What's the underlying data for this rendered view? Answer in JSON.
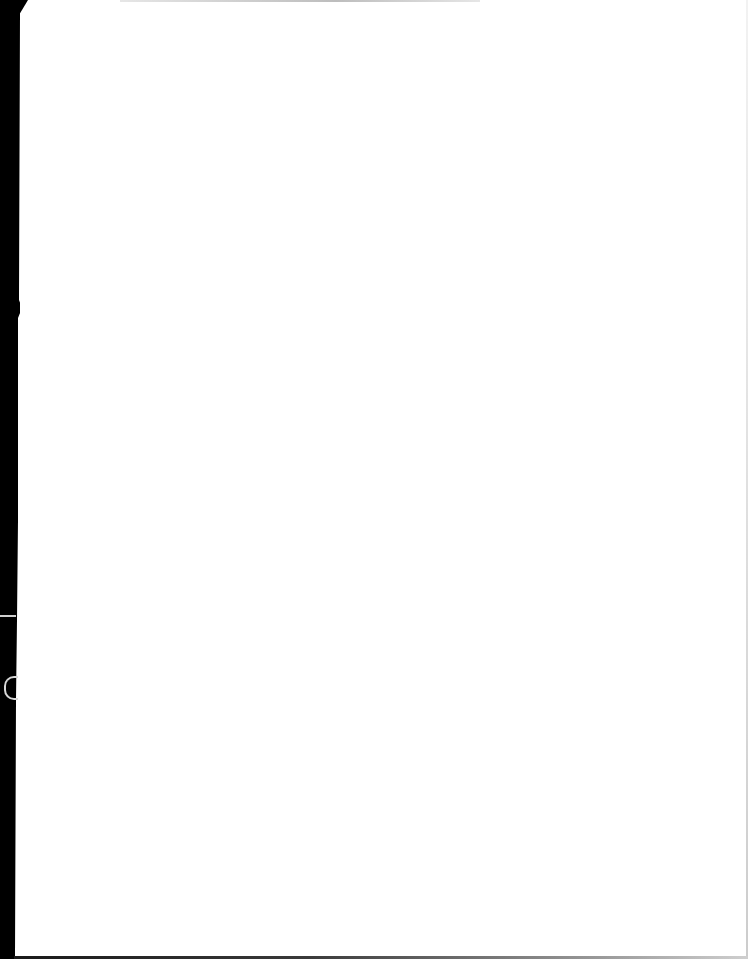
{
  "document": {
    "type": "scanned-page",
    "content": "",
    "text_blocks": []
  },
  "colors": {
    "paper": "#ffffff",
    "scan_border": "#000000",
    "edge_shadow": "#bdbdbd"
  }
}
